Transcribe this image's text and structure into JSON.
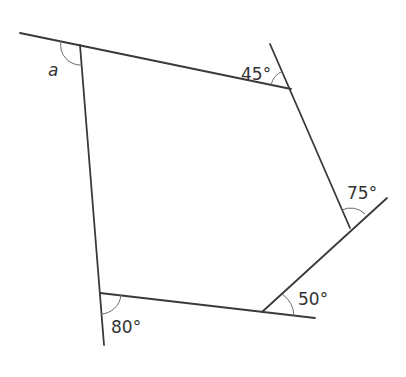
{
  "diagram": {
    "type": "polygon-exterior-angles",
    "shape": "pentagon",
    "colors": {
      "line": "#3a3a3a",
      "arc": "#6a6a6a",
      "text": "#333333",
      "background": "#ffffff"
    },
    "vertices": [
      {
        "id": "top-left",
        "x": 80,
        "y": 45
      },
      {
        "id": "top-right",
        "x": 291,
        "y": 89
      },
      {
        "id": "right",
        "x": 350,
        "y": 228
      },
      {
        "id": "bottom-right",
        "x": 262,
        "y": 312
      },
      {
        "id": "bottom-left",
        "x": 100,
        "y": 293
      }
    ],
    "angles": [
      {
        "vertex": "top-left",
        "label": "a"
      },
      {
        "vertex": "top-right",
        "label": "45°"
      },
      {
        "vertex": "right",
        "label": "75°"
      },
      {
        "vertex": "bottom-right",
        "label": "50°"
      },
      {
        "vertex": "bottom-left",
        "label": "80°"
      }
    ]
  }
}
